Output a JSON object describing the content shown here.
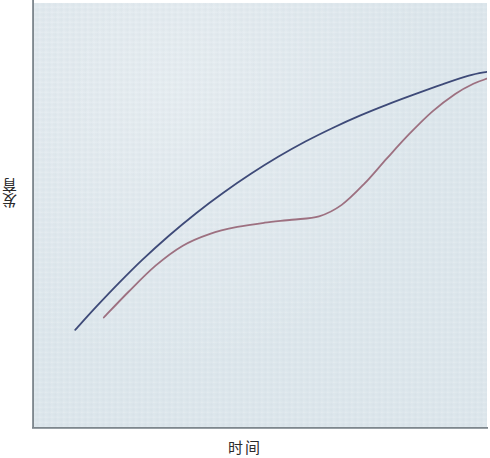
{
  "figure": {
    "background_color": "#ffffff",
    "panel_color": "#dce6ec",
    "axis_color": "#6e777d"
  },
  "axes": {
    "y_label": "发育",
    "x_label": "时间"
  },
  "chart_data": {
    "type": "line",
    "title": "",
    "subtitle": "",
    "xlabel": "时间",
    "ylabel": "发育",
    "grid": false,
    "legend": null,
    "xlim": [
      0,
      100
    ],
    "ylim": [
      0,
      100
    ],
    "x_tick_labels": [],
    "y_tick_labels": [],
    "annotations": [],
    "series": [
      {
        "name": "连续发育曲线",
        "color": "#3e4a78",
        "line_width": 1.8,
        "shape": "concave-decelerating",
        "x": [
          9.3,
          14,
          19,
          24,
          30,
          36,
          42,
          48,
          54,
          60,
          66,
          72,
          78,
          84,
          90,
          96,
          100
        ],
        "y": [
          23.1,
          28.6,
          34.2,
          39.5,
          45.3,
          50.6,
          55.4,
          59.8,
          63.8,
          67.4,
          70.6,
          73.5,
          76.1,
          78.5,
          80.8,
          82.9,
          83.8
        ]
      },
      {
        "name": "阶段发育曲线",
        "color": "#9d7080",
        "line_width": 1.8,
        "shape": "stepped-plateau",
        "x": [
          15.6,
          21,
          27,
          33,
          39,
          45,
          51,
          57,
          63,
          68,
          73,
          78,
          83,
          88,
          93,
          97,
          100
        ],
        "y": [
          26.0,
          32.0,
          38.2,
          42.9,
          45.7,
          47.3,
          48.3,
          49.0,
          49.8,
          52.5,
          57.5,
          63.5,
          69.3,
          74.5,
          78.6,
          81.0,
          82.2
        ]
      }
    ]
  }
}
